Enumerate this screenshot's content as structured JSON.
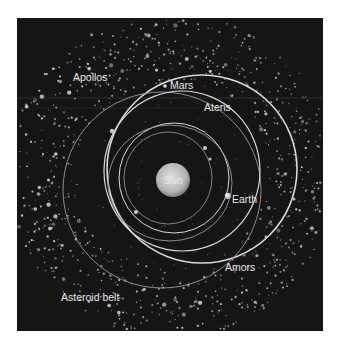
{
  "diagram": {
    "title_visible": false,
    "panel": {
      "background": "#151515",
      "x": 17,
      "y": 18,
      "width": 306,
      "height": 313
    },
    "colors": {
      "orbit": "#d9d9d9",
      "orbit_faint": "#9a9a9a",
      "sun": "#bdbdbd",
      "sun_edge": "#8a8a8a",
      "label": "#e6e6e6",
      "asteroid": "#8c8c8c"
    },
    "labels": {
      "apollos": "Apollos",
      "mars": "Mars",
      "atens": "Atens",
      "sun": "Sun",
      "earth": "Earth",
      "amors": "Amors",
      "asteroid_belt": "Asteroid belt"
    },
    "bodies": {
      "sun": {
        "cx": 173,
        "cy": 180,
        "r": 17
      },
      "earth": {
        "cx": 228,
        "cy": 196,
        "r": 3.2
      },
      "mars": {
        "cx": 165,
        "cy": 86,
        "r": 1.8
      }
    },
    "orbits": [
      {
        "name": "amors-orbit",
        "cx": 202,
        "cy": 169,
        "rx": 95,
        "ry": 94,
        "stroke": 1.6,
        "bright": true
      },
      {
        "name": "apollos-orbit",
        "cx": 162,
        "cy": 190,
        "rx": 99,
        "ry": 98,
        "stroke": 0.9,
        "bright": false
      },
      {
        "name": "mars-orbit",
        "cx": 182,
        "cy": 171,
        "rx": 78,
        "ry": 80,
        "stroke": 1.2,
        "bright": true
      },
      {
        "name": "earth-orbit",
        "cx": 174,
        "cy": 178,
        "rx": 55,
        "ry": 55,
        "stroke": 1.0,
        "bright": true
      },
      {
        "name": "atens-orbit",
        "cx": 170,
        "cy": 183,
        "rx": 62,
        "ry": 58,
        "stroke": 0.9,
        "bright": false
      },
      {
        "name": "inner-orbit",
        "cx": 168,
        "cy": 178,
        "rx": 44,
        "ry": 46,
        "stroke": 0.8,
        "bright": false
      }
    ]
  }
}
